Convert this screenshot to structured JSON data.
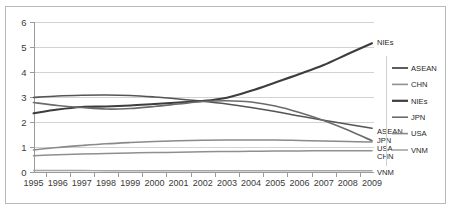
{
  "chart_data": {
    "type": "line",
    "title": "",
    "subtitle": "",
    "xlabel": "",
    "ylabel": "",
    "x": [
      1995,
      1996,
      1997,
      1998,
      1999,
      2000,
      2001,
      2002,
      2003,
      2004,
      2005,
      2006,
      2007,
      2008,
      2009
    ],
    "categories": [
      "1995",
      "1996",
      "1997",
      "1998",
      "1999",
      "2000",
      "2001",
      "2002",
      "2003",
      "2004",
      "2005",
      "2006",
      "2007",
      "2008",
      "2009"
    ],
    "ylim": [
      0,
      6
    ],
    "yticks": [
      "0",
      "1",
      "2",
      "3",
      "4",
      "5",
      "6"
    ],
    "xlim": [
      1995,
      2009
    ],
    "grid": true,
    "legend_position": "right",
    "series": [
      {
        "name": "ASEAN",
        "color": "#555555",
        "width": 1.7,
        "end_label": "ASEAN",
        "values": [
          2.98,
          3.04,
          3.07,
          3.08,
          3.06,
          3.0,
          2.92,
          2.83,
          2.72,
          2.58,
          2.42,
          2.24,
          2.07,
          1.91,
          1.75
        ]
      },
      {
        "name": "CHN",
        "color": "#8f8f8f",
        "width": 1.5,
        "end_label": "CHN",
        "values": [
          0.65,
          0.69,
          0.72,
          0.74,
          0.76,
          0.78,
          0.79,
          0.81,
          0.82,
          0.83,
          0.84,
          0.84,
          0.85,
          0.85,
          0.85
        ]
      },
      {
        "name": "NIEs",
        "color": "#3d3d3d",
        "width": 2.1,
        "end_label": "NIEs",
        "values": [
          2.35,
          2.5,
          2.6,
          2.62,
          2.66,
          2.72,
          2.78,
          2.84,
          2.97,
          3.25,
          3.58,
          3.92,
          4.28,
          4.72,
          5.15
        ]
      },
      {
        "name": "JPN",
        "color": "#6b6b6b",
        "width": 1.7,
        "end_label": "JPN",
        "values": [
          2.78,
          2.66,
          2.58,
          2.52,
          2.54,
          2.62,
          2.72,
          2.82,
          2.85,
          2.8,
          2.64,
          2.38,
          2.06,
          1.68,
          1.25
        ]
      },
      {
        "name": "USA",
        "color": "#8a8a8a",
        "width": 1.6,
        "end_label": "USA",
        "values": [
          0.88,
          0.98,
          1.06,
          1.13,
          1.18,
          1.22,
          1.25,
          1.27,
          1.28,
          1.28,
          1.28,
          1.26,
          1.24,
          1.22,
          1.2
        ]
      },
      {
        "name": "VNM",
        "color": "#a5a5a5",
        "width": 1.4,
        "end_label": "VNM",
        "values": [
          0.06,
          0.06,
          0.06,
          0.05,
          0.05,
          0.05,
          0.05,
          0.05,
          0.05,
          0.05,
          0.05,
          0.05,
          0.05,
          0.05,
          0.05
        ]
      }
    ],
    "legend_entries": [
      {
        "label": "ASEAN",
        "color": "#555555"
      },
      {
        "label": "CHN",
        "color": "#8f8f8f"
      },
      {
        "label": "NIEs",
        "color": "#3d3d3d"
      },
      {
        "label": "JPN",
        "color": "#6b6b6b"
      },
      {
        "label": "USA",
        "color": "#8a8a8a"
      },
      {
        "label": "VNM",
        "color": "#a5a5a5"
      }
    ],
    "end_labels": [
      {
        "label": "NIEs",
        "value": 5.15
      },
      {
        "label": "ASEAN",
        "value": 1.75
      },
      {
        "label": "JPN",
        "value": 1.25
      },
      {
        "label": "USA",
        "value": 1.2
      },
      {
        "label": "CHN",
        "value": 0.85
      },
      {
        "label": "VNM",
        "value": 0.05
      }
    ]
  },
  "colors": {
    "background": "#ffffff",
    "frame": "#b9b9b9",
    "gridline": "#d2d2d2",
    "axis": "#9a9a9a",
    "text": "#1f1f1f"
  }
}
